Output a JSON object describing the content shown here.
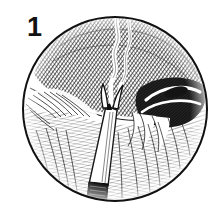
{
  "figure": {
    "number_label": "1",
    "caption": "",
    "medium": "line engraving / cross-hatched pen-and-ink",
    "frame_shape": "circle",
    "background_color": "#ffffff",
    "ink_color": "#151515",
    "frame_stroke_color": "#111111",
    "frame": {
      "center_x": 115,
      "center_y": 109,
      "radius": 93,
      "stroke_width": 2
    },
    "subject": {
      "scene": "close-up of hatched tissue with a pointed instrument inserted",
      "instrument_name": "probe-instrument",
      "instrument_tip": "forked pointed tip",
      "instrument_shaft_tone": "white highlighted cone",
      "instrument_handle_tone": "solid black",
      "handle_marking": "fine engraved rings"
    },
    "regions": [
      {
        "name": "upper-mass",
        "tone": "dark cross-hatch",
        "position": "top-center"
      },
      {
        "name": "fissure-streak",
        "tone": "light highlight",
        "position": "top-center"
      },
      {
        "name": "left-fur-ridge",
        "tone": "light fine hatch",
        "position": "left"
      },
      {
        "name": "lower-tissue-field",
        "tone": "mid fine hatch",
        "position": "bottom"
      },
      {
        "name": "right-cavity",
        "tone": "dark hollow",
        "position": "right"
      },
      {
        "name": "right-ridges",
        "tone": "light highlight",
        "position": "right"
      }
    ]
  }
}
